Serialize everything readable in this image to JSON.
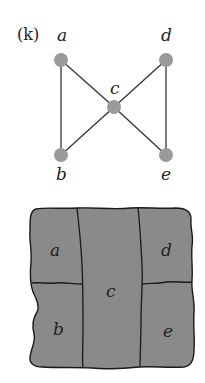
{
  "panel_label": "(k)",
  "graph": {
    "node_color": "#9a9a9a",
    "edge_color": "#333333",
    "nodes": [
      {
        "id": "a",
        "label": "a",
        "x": 61,
        "y": 60
      },
      {
        "id": "b",
        "label": "b",
        "x": 61,
        "y": 155
      },
      {
        "id": "c",
        "label": "c",
        "x": 114,
        "y": 107
      },
      {
        "id": "d",
        "label": "d",
        "x": 166,
        "y": 60
      },
      {
        "id": "e",
        "label": "e",
        "x": 166,
        "y": 155
      }
    ],
    "edges": [
      [
        "a",
        "b"
      ],
      [
        "a",
        "c"
      ],
      [
        "b",
        "c"
      ],
      [
        "c",
        "d"
      ],
      [
        "c",
        "e"
      ],
      [
        "d",
        "e"
      ]
    ]
  },
  "map": {
    "fill_color": "#8a8a8a",
    "border_color": "#1a1a1a",
    "regions": [
      {
        "id": "a",
        "label": "a"
      },
      {
        "id": "b",
        "label": "b"
      },
      {
        "id": "c",
        "label": "c"
      },
      {
        "id": "d",
        "label": "d"
      },
      {
        "id": "e",
        "label": "e"
      }
    ]
  }
}
